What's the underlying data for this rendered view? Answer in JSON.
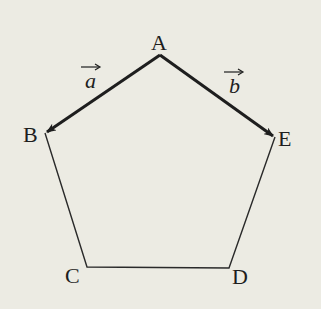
{
  "figure": {
    "type": "pentagon-vectors",
    "background": "#ecebe3",
    "stroke_color": "#1e1e1e",
    "vertices": [
      {
        "name": "A",
        "x": 160,
        "y": 55
      },
      {
        "name": "B",
        "x": 45,
        "y": 133
      },
      {
        "name": "C",
        "x": 87,
        "y": 267
      },
      {
        "name": "D",
        "x": 229,
        "y": 268
      },
      {
        "name": "E",
        "x": 275,
        "y": 137
      }
    ],
    "labels": {
      "A": "A",
      "B": "B",
      "C": "C",
      "D": "D",
      "E": "E"
    },
    "vectors": [
      {
        "name": "a",
        "from": "A",
        "to": "B",
        "label": "a",
        "arrow": "→"
      },
      {
        "name": "b",
        "from": "A",
        "to": "E",
        "label": "b",
        "arrow": "→"
      }
    ]
  }
}
